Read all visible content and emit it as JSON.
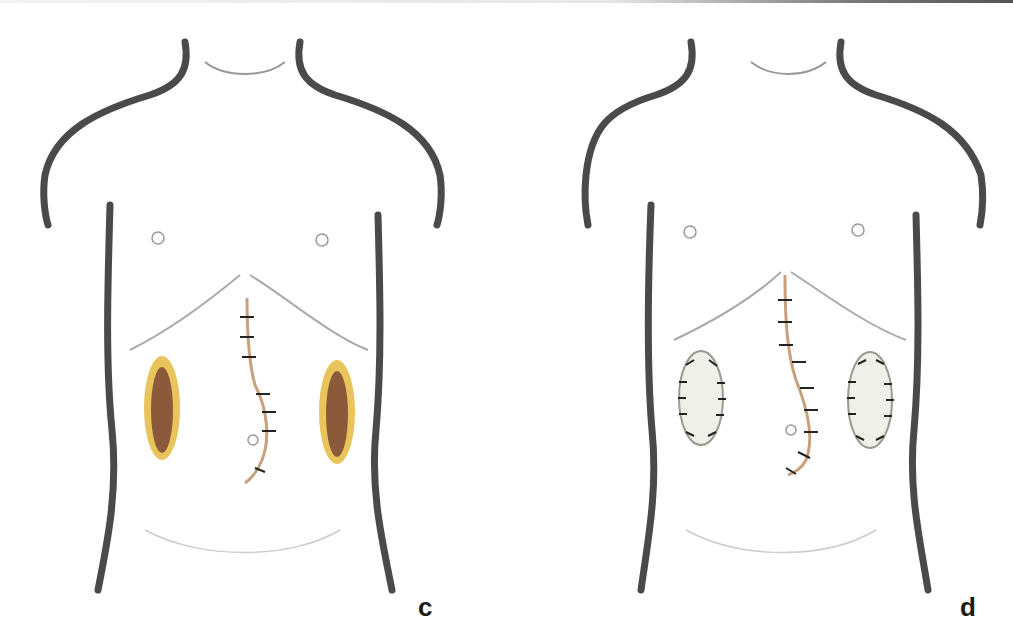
{
  "figure": {
    "type": "medical-illustration",
    "panels": [
      {
        "id": "c",
        "label": "c",
        "elements": [
          "midline sutured incision",
          "left open flank wound",
          "right open flank wound",
          "umbilicus",
          "nipples"
        ],
        "wound_state": "open",
        "wound_colors": {
          "rim": "#e8c45a",
          "bed": "#8a5a3a"
        }
      },
      {
        "id": "d",
        "label": "d",
        "elements": [
          "midline sutured incision",
          "left sutured flank wound",
          "right sutured flank wound",
          "umbilicus",
          "nipples"
        ],
        "wound_state": "closed with sutures",
        "wound_colors": {
          "rim": "#9a9a90",
          "bed": "#f0efe8"
        }
      }
    ],
    "colors": {
      "outline": "#4a4a4a",
      "incision": "#c9a07c",
      "suture": "#222222",
      "background": "#ffffff"
    }
  }
}
